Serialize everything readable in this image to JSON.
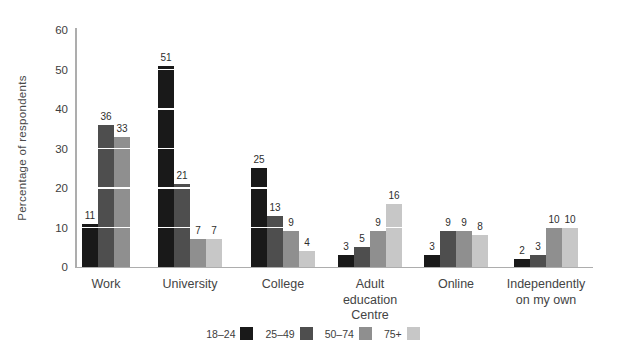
{
  "chart_data": {
    "type": "bar",
    "title": "",
    "xlabel": "",
    "ylabel": "Percentage of respondents",
    "ylim": [
      0,
      60
    ],
    "yticks": [
      0,
      10,
      20,
      30,
      40,
      50,
      60
    ],
    "grid": "white horizontal lines at each y tick, visible only where they cross bars",
    "legend_position": "bottom-center",
    "bar_value_labels": true,
    "categories": [
      "Work",
      "University",
      "College",
      "Adult education Centre",
      "Online",
      "Independently on my own"
    ],
    "category_tick_lines": [
      [
        "Work"
      ],
      [
        "University"
      ],
      [
        "College"
      ],
      [
        "Adult",
        "education",
        "Centre"
      ],
      [
        "Online"
      ],
      [
        "Independently",
        "on my own"
      ]
    ],
    "series": [
      {
        "name": "18–24",
        "color": "#191919",
        "values": [
          11,
          51,
          25,
          3,
          3,
          2
        ]
      },
      {
        "name": "25–49",
        "color": "#4e4e4e",
        "values": [
          36,
          21,
          13,
          5,
          9,
          3
        ]
      },
      {
        "name": "50–74",
        "color": "#8f8f8f",
        "values": [
          33,
          7,
          9,
          9,
          9,
          10
        ]
      },
      {
        "name": "75+",
        "color": "#c7c7c7",
        "values": [
          null,
          7,
          4,
          16,
          8,
          10
        ]
      }
    ]
  },
  "colors": {
    "axis": "#adadad",
    "gridline": "#ffffff",
    "text": "#3d3d3d",
    "background": "#ffffff"
  }
}
